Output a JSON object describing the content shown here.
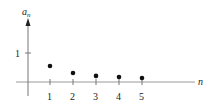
{
  "chart_data": {
    "type": "scatter",
    "title": "",
    "xlabel": "n",
    "ylabel": "a_n",
    "ylabel_main": "a",
    "ylabel_sub": "n",
    "x": [
      1,
      2,
      3,
      4,
      5
    ],
    "values": [
      0.55,
      0.31,
      0.21,
      0.17,
      0.14
    ],
    "xticks": [
      "1",
      "2",
      "3",
      "4",
      "5"
    ],
    "yticks": [
      "1"
    ],
    "xlim": [
      -0.9,
      6.3
    ],
    "ylim": [
      -0.3,
      2.2
    ],
    "grid": false,
    "legend": null
  }
}
